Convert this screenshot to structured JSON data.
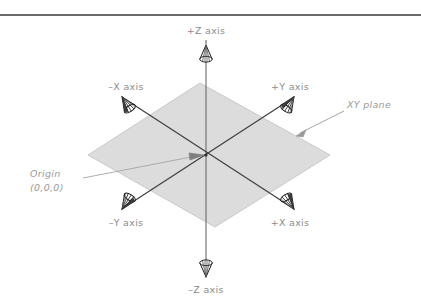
{
  "figure": {
    "background_color": "#ffffff",
    "top_rule": {
      "name": "page-rule",
      "color": "#3a3a3a",
      "y": 15,
      "x1": 0,
      "x2": 421,
      "thickness": 1.4
    }
  },
  "plane": {
    "label": "XY plane",
    "fill_color": "#dcdcdc",
    "stroke_color": "#c8c8c8",
    "corners": {
      "top": [
        200,
        83
      ],
      "right": [
        330,
        155
      ],
      "bottom": [
        215,
        227
      ],
      "left": [
        88,
        155
      ]
    }
  },
  "origin": {
    "label_line1": "Origin",
    "label_line2": "(0,0,0)",
    "point": [
      206,
      155
    ],
    "leader_color": "#a8a8a8"
  },
  "axes": {
    "line_color": "#555555",
    "arrow_color": "#222222",
    "items": [
      {
        "id": "pos-z",
        "label": "+Z axis",
        "tip": [
          206,
          46
        ],
        "label_pos": [
          206,
          32
        ],
        "anchor": "middle",
        "direction": "up"
      },
      {
        "id": "neg-z",
        "label": "–Z axis",
        "tip": [
          206,
          272
        ],
        "label_pos": [
          206,
          291
        ],
        "anchor": "middle",
        "direction": "down"
      },
      {
        "id": "neg-x",
        "label": "–X axis",
        "tip": [
          128,
          105
        ],
        "label_pos": [
          128,
          88
        ],
        "anchor": "middle",
        "direction": "up-left"
      },
      {
        "id": "pos-y",
        "label": "+Y axis",
        "tip": [
          288,
          105
        ],
        "label_pos": [
          288,
          88
        ],
        "anchor": "middle",
        "direction": "up-right"
      },
      {
        "id": "neg-y",
        "label": "–Y axis",
        "tip": [
          128,
          205
        ],
        "label_pos": [
          128,
          224
        ],
        "anchor": "middle",
        "direction": "down-left"
      },
      {
        "id": "pos-x",
        "label": "+X axis",
        "tip": [
          288,
          205
        ],
        "label_pos": [
          288,
          224
        ],
        "anchor": "middle",
        "direction": "down-right"
      }
    ]
  },
  "callouts": [
    {
      "id": "xy-plane-callout",
      "text": "XY plane",
      "text_pos": [
        348,
        106
      ],
      "leader_from": [
        345,
        110
      ],
      "leader_to": [
        298,
        134
      ],
      "color": "#9a9a9a"
    },
    {
      "id": "origin-callout",
      "text_pos": [
        30,
        180
      ],
      "leader_from": [
        88,
        178
      ],
      "leader_to": [
        203,
        156
      ],
      "color": "#9a9a9a"
    }
  ]
}
